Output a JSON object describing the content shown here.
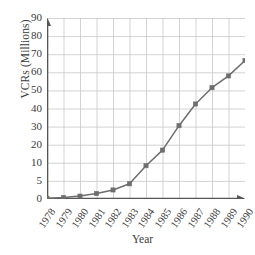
{
  "chart_data": {
    "type": "line",
    "title": "",
    "xlabel": "Year",
    "ylabel": "VCRs (Millions)",
    "categories": [
      "1978",
      "1979",
      "1980",
      "1981",
      "1982",
      "1983",
      "1984",
      "1985",
      "1986",
      "1987",
      "1988",
      "1989",
      "1990"
    ],
    "values": [
      0.2,
      0.4,
      0.8,
      1.5,
      2.5,
      4.2,
      9.2,
      17.0,
      30.5,
      42.5,
      51.5,
      58.0,
      66.5
    ],
    "series": [
      {
        "name": "VCRs",
        "values": [
          0.2,
          0.4,
          0.8,
          1.5,
          2.5,
          4.2,
          9.2,
          17.0,
          30.5,
          42.5,
          51.5,
          58.0,
          66.5
        ]
      }
    ],
    "xtick_labels": [
      "1978",
      "1979",
      "1980",
      "1981",
      "1982",
      "1983",
      "1984",
      "1985",
      "1986",
      "1987",
      "1988",
      "1989",
      "1990"
    ],
    "ytick_labels": [
      "0",
      "5",
      "10",
      "20",
      "30",
      "40",
      "50",
      "60",
      "70",
      "80",
      "90"
    ],
    "ytick_values": [
      0,
      5,
      10,
      20,
      30,
      40,
      50,
      60,
      70,
      80,
      90
    ],
    "ylim": [
      0,
      90
    ],
    "xlim": [
      "1978",
      "1990"
    ],
    "y_scale_note": "non-uniform: 0-5 and 5-10 intervals drawn wider than the uniform 10-unit steps above 10",
    "grid": true,
    "legend": "none",
    "marker": "square",
    "line_color": "#6e6e6e",
    "marker_color": "#6e6e6e",
    "grid_color": "#c8c8cc",
    "axis_color": "#555555",
    "background_color": "#ffffff"
  }
}
